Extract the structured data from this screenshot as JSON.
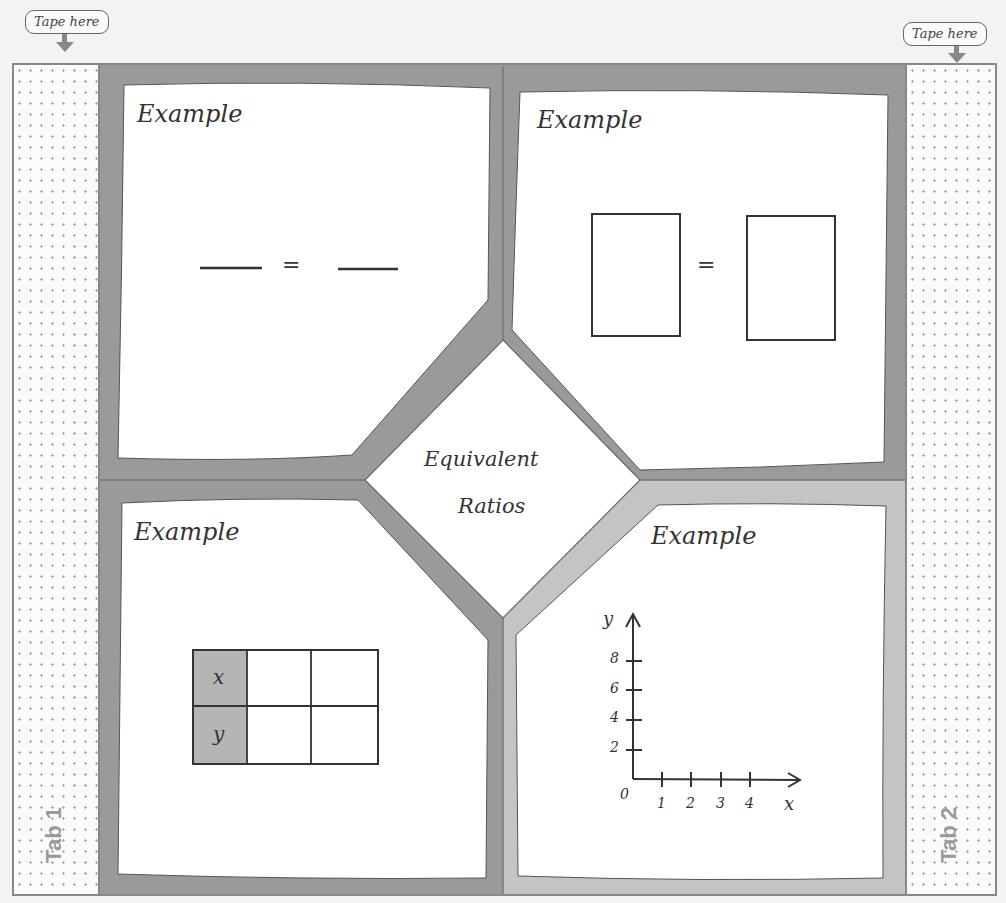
{
  "tape": {
    "left_label": "Tape here",
    "right_label": "Tape here"
  },
  "tabs": {
    "left": "Tab 1",
    "right": "Tab 2"
  },
  "center": {
    "line1": "Equivalent",
    "line2": "Ratios"
  },
  "panels": {
    "top_left": {
      "title": "Example",
      "equals": "="
    },
    "top_right": {
      "title": "Example",
      "equals": "="
    },
    "bottom_left": {
      "title": "Example",
      "row1": "x",
      "row2": "y"
    },
    "bottom_right": {
      "title": "Example",
      "y_axis": "y",
      "x_axis": "x",
      "origin": "0",
      "y_ticks": [
        "2",
        "4",
        "6",
        "8"
      ],
      "x_ticks": [
        "1",
        "2",
        "3",
        "4"
      ]
    }
  },
  "colors": {
    "frame": "#9a9a9a",
    "frame_light": "#c4c4c4",
    "paper": "#ffffff",
    "ink": "#333333",
    "shade": "#b5b5b5"
  }
}
